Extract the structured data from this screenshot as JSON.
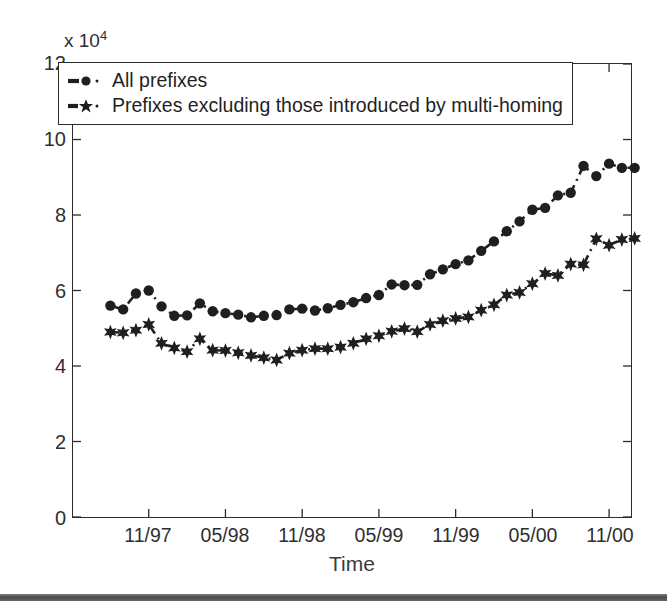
{
  "chart_data": {
    "type": "line",
    "title": "",
    "xlabel": "Time",
    "ylabel": "",
    "y_multiplier_label": "x 10",
    "y_multiplier_exponent": "4",
    "y_multiplier_value": 10000,
    "ylim": [
      0,
      12
    ],
    "yticks": [
      0,
      2,
      4,
      6,
      8,
      10,
      12
    ],
    "ytick_labels": [
      "0",
      "2",
      "4",
      "6",
      "8",
      "10",
      "12"
    ],
    "xlim": [
      "08/97",
      "02/01"
    ],
    "xticks": [
      "11/97",
      "05/98",
      "11/98",
      "05/99",
      "11/99",
      "05/00",
      "11/00"
    ],
    "xtick_labels": [
      "11/97",
      "05/98",
      "11/98",
      "05/99",
      "11/99",
      "05/00",
      "11/00"
    ],
    "grid": false,
    "legend_position": "upper-left-inside",
    "x": [
      "08/97",
      "09/97",
      "10/97",
      "11/97",
      "12/97",
      "01/98",
      "02/98",
      "03/98",
      "04/98",
      "05/98",
      "06/98",
      "07/98",
      "08/98",
      "09/98",
      "10/98",
      "11/98",
      "12/98",
      "01/99",
      "02/99",
      "03/99",
      "04/99",
      "05/99",
      "06/99",
      "07/99",
      "08/99",
      "09/99",
      "10/99",
      "11/99",
      "12/99",
      "01/00",
      "02/00",
      "03/00",
      "04/00",
      "05/00",
      "06/00",
      "07/00",
      "08/00",
      "09/00",
      "10/00",
      "11/00",
      "12/00",
      "01/01"
    ],
    "series": [
      {
        "name": "All prefixes",
        "marker": "circle",
        "linestyle": "dash-dot",
        "color": "#1f1f1f",
        "values": [
          5.6,
          5.5,
          5.92,
          6.0,
          5.58,
          5.33,
          5.34,
          5.66,
          5.45,
          5.4,
          5.36,
          5.29,
          5.33,
          5.35,
          5.5,
          5.52,
          5.47,
          5.53,
          5.62,
          5.69,
          5.8,
          5.88,
          6.16,
          6.14,
          6.15,
          6.43,
          6.56,
          6.7,
          6.8,
          7.05,
          7.3,
          7.57,
          7.83,
          8.14,
          8.19,
          8.52,
          8.59,
          9.3,
          9.03,
          9.36,
          9.25,
          9.25
        ]
      },
      {
        "name": "Prefixes excluding those introduced by multi-homing",
        "marker": "star6",
        "linestyle": "dash-dot",
        "color": "#1f1f1f",
        "values": [
          4.9,
          4.88,
          4.95,
          5.1,
          4.6,
          4.48,
          4.38,
          4.72,
          4.42,
          4.41,
          4.35,
          4.28,
          4.22,
          4.16,
          4.34,
          4.42,
          4.46,
          4.46,
          4.5,
          4.6,
          4.72,
          4.8,
          4.92,
          4.99,
          4.91,
          5.1,
          5.2,
          5.26,
          5.3,
          5.48,
          5.62,
          5.88,
          5.95,
          6.18,
          6.45,
          6.4,
          6.7,
          6.68,
          7.37,
          7.2,
          7.35,
          7.38
        ]
      }
    ]
  },
  "legend": {
    "items": [
      {
        "label": "All prefixes",
        "marker": "circle"
      },
      {
        "label": "Prefixes excluding those introduced by multi-homing",
        "marker": "star6"
      }
    ]
  },
  "axes": {
    "x_title": "Time",
    "exponent_prefix": "x 10",
    "exponent_power": "4"
  }
}
